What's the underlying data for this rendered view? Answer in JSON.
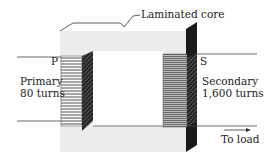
{
  "diagram": {
    "core_label": "Laminated core",
    "primary": {
      "terminal": "P",
      "name": "Primary",
      "turns": "80 turns"
    },
    "secondary": {
      "terminal": "S",
      "name": "Secondary",
      "turns": "1,600 turns"
    },
    "output_label": "To load",
    "colors": {
      "core_face": "#f2f2f2",
      "core_edge": "#1a1a1a",
      "winding": "#555555",
      "wire": "#444444"
    }
  }
}
